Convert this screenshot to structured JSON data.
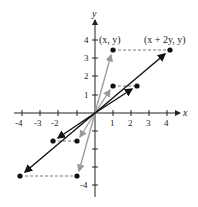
{
  "diagram": {
    "type": "shear transformation of vectors",
    "axes": {
      "x_label": "x",
      "y_label": "y",
      "x_ticks": [
        "-4",
        "-3",
        "-2",
        "1",
        "2",
        "3",
        "4"
      ],
      "y_ticks": [
        "4",
        "3",
        "2",
        "1",
        "-4"
      ]
    },
    "labels": {
      "original": "(x, y)",
      "transformed": "(x + 2y, y)"
    },
    "colors": {
      "original_vectors": "#9a9a9a",
      "transformed_vectors": "#111111",
      "axes": "#222222",
      "dashed": "#555555"
    },
    "points": [
      {
        "name": "p1",
        "x": 1,
        "y": 3.5,
        "image_x": 4.3,
        "image_y": 3.5
      },
      {
        "name": "p2",
        "x": 1,
        "y": 1.5,
        "image_x": 2.4,
        "image_y": 1.5
      },
      {
        "name": "p3",
        "x": -1,
        "y": -1.5,
        "image_x": -2.3,
        "image_y": -1.5
      },
      {
        "name": "p4",
        "x": -1,
        "y": -3.5,
        "image_x": -4.2,
        "image_y": -3.5
      }
    ]
  }
}
